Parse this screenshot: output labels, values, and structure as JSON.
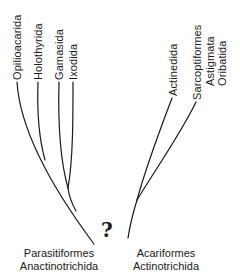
{
  "diagram": {
    "type": "phylogenetic-tree",
    "left_clade": {
      "name": "Parasitiformes",
      "alt_name": "Anactinotrichida",
      "taxa": [
        "Opilioacarida",
        "Holothyrida",
        "Gamasida",
        "Ixodida"
      ]
    },
    "right_clade": {
      "name": "Acariformes",
      "alt_name": "Actinotrichida",
      "taxa": [
        {
          "label": "Actinedida"
        },
        {
          "label": "Sarcoptiformes",
          "sub": [
            "Astigmata",
            "Oribatida"
          ]
        }
      ]
    },
    "uncertain_link_marker": "?",
    "line_color": "#1a1a1a"
  }
}
